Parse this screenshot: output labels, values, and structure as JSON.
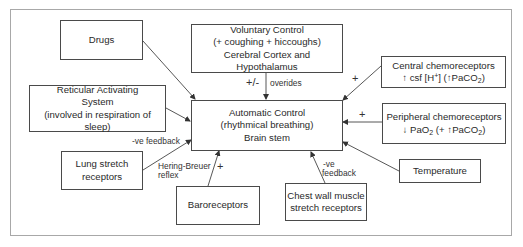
{
  "diagram": {
    "center": {
      "line1": "Automatic Control",
      "line2": "(rhythmical breathing)",
      "line3": "Brain stem"
    },
    "nodes": {
      "drugs": {
        "label": "Drugs"
      },
      "voluntary": {
        "line1": "Voluntary Control",
        "line2": "(+ coughing + hiccoughs)",
        "line3": "Cerebral Cortex and Hypothalamus"
      },
      "central_chemo": {
        "line1": "Central chemoreceptors",
        "line2_arrow": "↑",
        "line2_a": " csf [H",
        "line2_sup": "+",
        "line2_b": "] (",
        "line2_arrow2": "↑",
        "line2_c": "PaCO",
        "line2_sub": "2",
        "line2_d": ")"
      },
      "reticular": {
        "line1": "Reticular Activating",
        "line2": "System",
        "line3": "(involved in respiration of sleep)"
      },
      "peripheral_chemo": {
        "line1": "Peripheral chemoreceptors",
        "line2_arrow": "↓",
        "line2_a": " PaO",
        "line2_sub1": "2",
        "line2_b": " (+ ",
        "line2_arrow2": "↑",
        "line2_c": "PaCO",
        "line2_sub2": "2",
        "line2_d": ")"
      },
      "lung_stretch": {
        "line1": "Lung stretch",
        "line2": "receptors"
      },
      "baroreceptors": {
        "label": "Baroreceptors"
      },
      "chest_wall": {
        "line1": "Chest wall muscle",
        "line2": "stretch receptors"
      },
      "temperature": {
        "label": "Temperature"
      }
    },
    "edge_labels": {
      "voluntary_sign": "+/-",
      "voluntary_text": "overides",
      "central_sign": "+",
      "peripheral_sign": "+",
      "lung_feedback": "-ve feedback",
      "lung_reflex_1": "Hering-Breuer",
      "lung_reflex_2": "reflex",
      "baro_sign": "+",
      "chest_feedback_1": "-ve",
      "chest_feedback_2": "feedback"
    }
  }
}
